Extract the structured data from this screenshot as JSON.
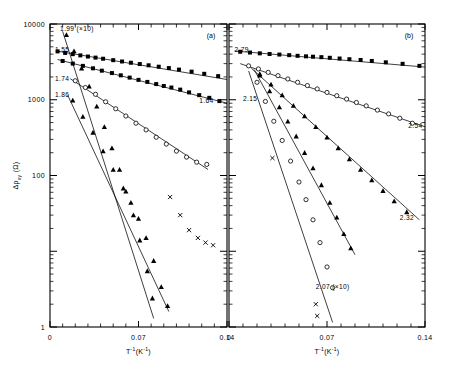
{
  "figure": {
    "background": "#ffffff",
    "ink": "#000000",
    "panels": [
      {
        "id": "a",
        "label": "(a)"
      },
      {
        "id": "b",
        "label": "(b)"
      }
    ]
  },
  "axes": {
    "y": {
      "title_delta": "Δ",
      "title_rho": "ρ",
      "title_sub": "xy",
      "title_unit": "(Ω)",
      "title_full": "Δρxy (Ω)",
      "scale": "log",
      "min": 1,
      "max": 10000,
      "labels": [
        "10000",
        "1000",
        "100",
        "1"
      ],
      "label_values": [
        10000,
        1000,
        100,
        1
      ]
    },
    "x": {
      "title_main": "T",
      "title_sup1": "-1",
      "title_paren_open": "(K",
      "title_sup2": "-1",
      "title_paren_close": ")",
      "title_full": "T-1(K-1)",
      "scale": "linear",
      "min": 0,
      "max": 0.14,
      "labels": [
        "0",
        "0.07",
        "0.14"
      ],
      "label_values": [
        0,
        0.07,
        0.14
      ],
      "minor_tick_step": 0.01
    }
  },
  "chart_data": {
    "type": "scatter",
    "title": "",
    "xlabel": "T-1(K-1)",
    "ylabel": "Δρxy (Ω)",
    "xlim": [
      0,
      0.14
    ],
    "ylim": [
      1,
      10000
    ],
    "yscale": "log",
    "grid": false,
    "legend": "inline-labels",
    "panels": [
      {
        "id": "a",
        "label": "(a)",
        "series": [
          {
            "name": "1.55",
            "label": "1.55",
            "label_x": 0.004,
            "label_y": 4300,
            "marker": "filled-square",
            "scaled": false,
            "fit": {
              "x0": 0.005,
              "y0": 4400,
              "x1": 0.14,
              "y1": 1850
            },
            "points": [
              {
                "x": 0.006,
                "y": 4350
              },
              {
                "x": 0.012,
                "y": 4150
              },
              {
                "x": 0.018,
                "y": 4000
              },
              {
                "x": 0.024,
                "y": 3850
              },
              {
                "x": 0.03,
                "y": 3720
              },
              {
                "x": 0.036,
                "y": 3600
              },
              {
                "x": 0.042,
                "y": 3480
              },
              {
                "x": 0.05,
                "y": 3330
              },
              {
                "x": 0.057,
                "y": 3200
              },
              {
                "x": 0.064,
                "y": 3080
              },
              {
                "x": 0.071,
                "y": 2960
              },
              {
                "x": 0.078,
                "y": 2850
              },
              {
                "x": 0.086,
                "y": 2730
              },
              {
                "x": 0.094,
                "y": 2620
              },
              {
                "x": 0.102,
                "y": 2500
              },
              {
                "x": 0.112,
                "y": 2350
              },
              {
                "x": 0.122,
                "y": 2200
              },
              {
                "x": 0.133,
                "y": 2050
              }
            ]
          },
          {
            "name": "1.64",
            "label": "1.64",
            "label_x": 0.118,
            "label_y": 900,
            "marker": "filled-square",
            "scaled": false,
            "fit": {
              "x0": 0.006,
              "y0": 3400,
              "x1": 0.14,
              "y1": 900
            },
            "points": [
              {
                "x": 0.01,
                "y": 3250
              },
              {
                "x": 0.018,
                "y": 3000
              },
              {
                "x": 0.026,
                "y": 2800
              },
              {
                "x": 0.034,
                "y": 2600
              },
              {
                "x": 0.041,
                "y": 2420
              },
              {
                "x": 0.049,
                "y": 2250
              },
              {
                "x": 0.056,
                "y": 2100
              },
              {
                "x": 0.063,
                "y": 1960
              },
              {
                "x": 0.07,
                "y": 1830
              },
              {
                "x": 0.077,
                "y": 1720
              },
              {
                "x": 0.084,
                "y": 1610
              },
              {
                "x": 0.09,
                "y": 1520
              },
              {
                "x": 0.096,
                "y": 1450
              },
              {
                "x": 0.103,
                "y": 1360
              },
              {
                "x": 0.11,
                "y": 1250
              },
              {
                "x": 0.118,
                "y": 1150
              },
              {
                "x": 0.126,
                "y": 1060
              },
              {
                "x": 0.134,
                "y": 960
              }
            ]
          },
          {
            "name": "1.74",
            "label": "1.74",
            "label_x": 0.004,
            "label_y": 1750,
            "marker": "open-circle",
            "scaled": false,
            "fit": {
              "x0": 0.016,
              "y0": 1900,
              "x1": 0.125,
              "y1": 120
            },
            "points": [
              {
                "x": 0.02,
                "y": 1780
              },
              {
                "x": 0.028,
                "y": 1450
              },
              {
                "x": 0.036,
                "y": 1180
              },
              {
                "x": 0.044,
                "y": 940
              },
              {
                "x": 0.052,
                "y": 760
              },
              {
                "x": 0.06,
                "y": 610
              },
              {
                "x": 0.068,
                "y": 490
              },
              {
                "x": 0.076,
                "y": 400
              },
              {
                "x": 0.084,
                "y": 320
              },
              {
                "x": 0.092,
                "y": 260
              },
              {
                "x": 0.1,
                "y": 210
              },
              {
                "x": 0.108,
                "y": 175
              },
              {
                "x": 0.116,
                "y": 150
              },
              {
                "x": 0.124,
                "y": 140
              }
            ]
          },
          {
            "name": "1.86",
            "label": "1.86",
            "label_x": 0.004,
            "label_y": 1080,
            "marker": "filled-triangle",
            "scaled": false,
            "fit": {
              "x0": 0.014,
              "y0": 1150,
              "x1": 0.094,
              "y1": 1.6
            },
            "points": [
              {
                "x": 0.018,
                "y": 980
              },
              {
                "x": 0.026,
                "y": 600
              },
              {
                "x": 0.034,
                "y": 370
              },
              {
                "x": 0.042,
                "y": 210
              },
              {
                "x": 0.05,
                "y": 120
              },
              {
                "x": 0.058,
                "y": 68
              },
              {
                "x": 0.064,
                "y": 44
              },
              {
                "x": 0.07,
                "y": 27
              },
              {
                "x": 0.076,
                "y": 15
              },
              {
                "x": 0.082,
                "y": 7.5
              },
              {
                "x": 0.088,
                "y": 3.4
              },
              {
                "x": 0.093,
                "y": 1.9
              }
            ]
          },
          {
            "name": "1.99",
            "label": "1.99 (×10)",
            "label_x": 0.008,
            "label_y": 8200,
            "marker": "filled-triangle",
            "scaled": true,
            "scale_factor": 10,
            "fit": {
              "x0": 0.01,
              "y0": 8000,
              "x1": 0.082,
              "y1": 1.3
            },
            "points": [
              {
                "x": 0.013,
                "y": 7200
              },
              {
                "x": 0.019,
                "y": 4400
              },
              {
                "x": 0.025,
                "y": 2600
              },
              {
                "x": 0.031,
                "y": 1500
              },
              {
                "x": 0.037,
                "y": 820
              },
              {
                "x": 0.043,
                "y": 440
              },
              {
                "x": 0.049,
                "y": 230
              },
              {
                "x": 0.055,
                "y": 120
              },
              {
                "x": 0.06,
                "y": 62
              },
              {
                "x": 0.066,
                "y": 30
              },
              {
                "x": 0.071,
                "y": 14
              },
              {
                "x": 0.077,
                "y": 5.5
              },
              {
                "x": 0.081,
                "y": 2.4
              }
            ]
          },
          {
            "name": "x-series",
            "label": "",
            "marker": "cross",
            "scaled": false,
            "fit": null,
            "points": [
              {
                "x": 0.095,
                "y": 52
              },
              {
                "x": 0.103,
                "y": 30
              },
              {
                "x": 0.11,
                "y": 19
              },
              {
                "x": 0.117,
                "y": 15
              },
              {
                "x": 0.123,
                "y": 13
              },
              {
                "x": 0.129,
                "y": 12
              }
            ]
          }
        ]
      },
      {
        "id": "b",
        "label": "(b)",
        "series": [
          {
            "name": "2.79",
            "label": "2.79",
            "label_x": 0.004,
            "label_y": 4300,
            "marker": "filled-square",
            "scaled": false,
            "fit": {
              "x0": 0.004,
              "y0": 4400,
              "x1": 0.14,
              "y1": 2700
            },
            "points": [
              {
                "x": 0.008,
                "y": 4300
              },
              {
                "x": 0.015,
                "y": 4200
              },
              {
                "x": 0.022,
                "y": 4100
              },
              {
                "x": 0.029,
                "y": 4020
              },
              {
                "x": 0.036,
                "y": 3950
              },
              {
                "x": 0.043,
                "y": 3880
              },
              {
                "x": 0.049,
                "y": 3800
              },
              {
                "x": 0.055,
                "y": 3740
              },
              {
                "x": 0.06,
                "y": 3700
              },
              {
                "x": 0.066,
                "y": 3650
              },
              {
                "x": 0.072,
                "y": 3580
              },
              {
                "x": 0.079,
                "y": 3500
              },
              {
                "x": 0.086,
                "y": 3430
              },
              {
                "x": 0.094,
                "y": 3350
              },
              {
                "x": 0.102,
                "y": 3250
              },
              {
                "x": 0.112,
                "y": 3120
              },
              {
                "x": 0.124,
                "y": 2980
              },
              {
                "x": 0.136,
                "y": 2800
              }
            ]
          },
          {
            "name": "2.54",
            "label": "2.54",
            "label_x": 0.128,
            "label_y": 420,
            "marker": "open-circle",
            "scaled": false,
            "fit": {
              "x0": 0.008,
              "y0": 3000,
              "x1": 0.14,
              "y1": 440
            },
            "points": [
              {
                "x": 0.014,
                "y": 2800
              },
              {
                "x": 0.021,
                "y": 2550
              },
              {
                "x": 0.028,
                "y": 2300
              },
              {
                "x": 0.035,
                "y": 2080
              },
              {
                "x": 0.042,
                "y": 1880
              },
              {
                "x": 0.049,
                "y": 1700
              },
              {
                "x": 0.056,
                "y": 1540
              },
              {
                "x": 0.063,
                "y": 1390
              },
              {
                "x": 0.07,
                "y": 1250
              },
              {
                "x": 0.077,
                "y": 1130
              },
              {
                "x": 0.084,
                "y": 1020
              },
              {
                "x": 0.091,
                "y": 920
              },
              {
                "x": 0.098,
                "y": 830
              },
              {
                "x": 0.106,
                "y": 730
              },
              {
                "x": 0.114,
                "y": 650
              },
              {
                "x": 0.122,
                "y": 570
              },
              {
                "x": 0.131,
                "y": 490
              }
            ]
          },
          {
            "name": "2.32",
            "label": "2.32",
            "label_x": 0.122,
            "label_y": 26,
            "marker": "filled-triangle",
            "scaled": false,
            "fit": {
              "x0": 0.016,
              "y0": 2600,
              "x1": 0.136,
              "y1": 26
            },
            "points": [
              {
                "x": 0.022,
                "y": 2200
              },
              {
                "x": 0.03,
                "y": 1600
              },
              {
                "x": 0.038,
                "y": 1150
              },
              {
                "x": 0.046,
                "y": 840
              },
              {
                "x": 0.054,
                "y": 610
              },
              {
                "x": 0.062,
                "y": 440
              },
              {
                "x": 0.07,
                "y": 320
              },
              {
                "x": 0.078,
                "y": 230
              },
              {
                "x": 0.086,
                "y": 165
              },
              {
                "x": 0.094,
                "y": 120
              },
              {
                "x": 0.102,
                "y": 87
              },
              {
                "x": 0.11,
                "y": 63
              },
              {
                "x": 0.118,
                "y": 46
              },
              {
                "x": 0.127,
                "y": 33
              }
            ]
          },
          {
            "name": "2.15",
            "label": "2.15",
            "label_x": 0.01,
            "label_y": 950,
            "marker": "filled-triangle",
            "scaled": false,
            "fit": {
              "x0": 0.018,
              "y0": 2500,
              "x1": 0.09,
              "y1": 9
            },
            "points": [
              {
                "x": 0.022,
                "y": 2100
              },
              {
                "x": 0.029,
                "y": 1300
              },
              {
                "x": 0.036,
                "y": 800
              },
              {
                "x": 0.042,
                "y": 520
              },
              {
                "x": 0.048,
                "y": 330
              },
              {
                "x": 0.054,
                "y": 200
              },
              {
                "x": 0.06,
                "y": 125
              },
              {
                "x": 0.066,
                "y": 75
              },
              {
                "x": 0.072,
                "y": 44
              },
              {
                "x": 0.077,
                "y": 28
              },
              {
                "x": 0.082,
                "y": 17
              },
              {
                "x": 0.087,
                "y": 11
              }
            ]
          },
          {
            "name": "2.07",
            "label": "2.07 (×10)",
            "label_x": 0.062,
            "label_y": 3.2,
            "marker": "open-circle",
            "scaled": true,
            "scale_factor": 10,
            "fit": {
              "x0": 0.014,
              "y0": 2400,
              "x1": 0.074,
              "y1": 1.15
            },
            "points": [
              {
                "x": 0.02,
                "y": 1700
              },
              {
                "x": 0.026,
                "y": 950
              },
              {
                "x": 0.032,
                "y": 520
              },
              {
                "x": 0.038,
                "y": 290
              },
              {
                "x": 0.044,
                "y": 155
              },
              {
                "x": 0.05,
                "y": 82
              },
              {
                "x": 0.055,
                "y": 48
              },
              {
                "x": 0.06,
                "y": 26
              },
              {
                "x": 0.065,
                "y": 13
              },
              {
                "x": 0.07,
                "y": 6.2
              },
              {
                "x": 0.074,
                "y": 3.3
              }
            ]
          },
          {
            "name": "x-series-b",
            "label": "",
            "marker": "cross",
            "scaled": false,
            "fit": null,
            "points": [
              {
                "x": 0.031,
                "y": 170
              },
              {
                "x": 0.062,
                "y": 2.0
              },
              {
                "x": 0.063,
                "y": 1.4
              }
            ]
          }
        ]
      }
    ]
  }
}
